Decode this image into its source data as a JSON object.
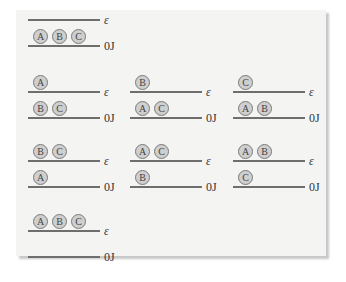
{
  "labels": {
    "upper": "ε",
    "lower": "0J"
  },
  "colors": {
    "panel": "#f4f4f3",
    "line": "#6e6e6e",
    "particle_fill": "#cfcfcf",
    "particle_border": "#7a7a7a"
  },
  "configurations": [
    {
      "id": "all-ground",
      "upper": [],
      "lower": [
        "A",
        "B",
        "C"
      ]
    },
    {
      "id": "A-excited",
      "upper": [
        "A"
      ],
      "lower": [
        "B",
        "C"
      ]
    },
    {
      "id": "B-excited",
      "upper": [
        "B"
      ],
      "lower": [
        "A",
        "C"
      ]
    },
    {
      "id": "C-excited",
      "upper": [
        "C"
      ],
      "lower": [
        "A",
        "B"
      ]
    },
    {
      "id": "BC-excited",
      "upper": [
        "B",
        "C"
      ],
      "lower": [
        "A"
      ]
    },
    {
      "id": "AC-excited",
      "upper": [
        "A",
        "C"
      ],
      "lower": [
        "B"
      ]
    },
    {
      "id": "AB-excited",
      "upper": [
        "A",
        "B"
      ],
      "lower": [
        "C"
      ]
    },
    {
      "id": "all-excited",
      "upper": [
        "A",
        "B",
        "C"
      ],
      "lower": []
    }
  ]
}
